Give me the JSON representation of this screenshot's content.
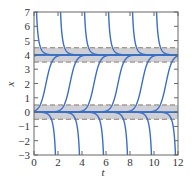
{
  "chart_data": {
    "type": "line",
    "title": "",
    "xlabel": "t",
    "ylabel": "x",
    "xlim": [
      0,
      12
    ],
    "ylim": [
      -3,
      7
    ],
    "xticks": [
      0,
      2,
      4,
      6,
      8,
      10,
      12
    ],
    "yticks": [
      -3,
      -2,
      -1,
      0,
      1,
      2,
      3,
      4,
      5,
      6,
      7
    ],
    "grid": false,
    "legend": null,
    "equilibria": [
      {
        "x": 4,
        "band": [
          3.5,
          4.5
        ],
        "stability": "stable"
      },
      {
        "x": 0,
        "band": [
          -0.5,
          0.5
        ],
        "stability": "unstable"
      }
    ],
    "series": [
      {
        "name": "upper-decay",
        "description": "solutions above x=4 coming down from +infinity to 4",
        "vertical_asymptotes_t": [
          0,
          2,
          4,
          6,
          8,
          10
        ]
      },
      {
        "name": "s-curves",
        "description": "solutions between 0 and 4 rising from 0 to 4",
        "midpoints_t": [
          -1,
          1,
          3,
          5,
          7,
          9,
          11
        ]
      },
      {
        "name": "lower-blowup",
        "description": "solutions below 0 dropping from 0 to -infinity",
        "vertical_asymptotes_t": [
          2,
          4,
          6,
          8,
          10,
          12
        ]
      },
      {
        "name": "equilibrium-4",
        "values_constant": 4
      },
      {
        "name": "equilibrium-0",
        "values_constant": 0
      }
    ],
    "colors": {
      "curve": "#3a6fc4",
      "band": "#cfd0d6",
      "dash": "#8a7a6a",
      "axis": "#666666"
    }
  },
  "axes": {
    "x_label": "t",
    "y_label": "x",
    "x_tick_labels": [
      "0",
      "2",
      "4",
      "6",
      "8",
      "10",
      "12"
    ],
    "y_tick_labels": [
      "-3",
      "-2",
      "-1",
      "0",
      "1",
      "2",
      "3",
      "4",
      "5",
      "6",
      "7"
    ]
  }
}
